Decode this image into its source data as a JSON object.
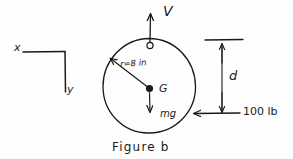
{
  "figure": {
    "caption": "Figure  b",
    "background_color": "#fefefe",
    "ink_color": "#1a1a1a"
  },
  "axes": {
    "x_label": "x",
    "y_label": "y"
  },
  "wheel": {
    "center_label": "G",
    "radius_label": "r=8 in",
    "radius_value": 8,
    "radius_units": "in"
  },
  "vectors": {
    "velocity_label": "V",
    "weight_label": "mg",
    "applied_force_label": "100 lb",
    "applied_force_value": 100,
    "applied_force_units": "lb"
  },
  "dimensions": {
    "d_label": "d"
  }
}
